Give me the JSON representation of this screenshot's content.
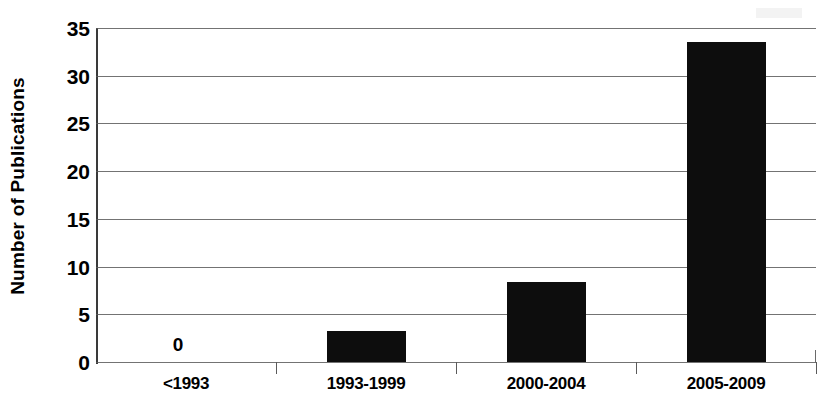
{
  "chart_data": {
    "type": "bar",
    "title": "",
    "xlabel": "",
    "ylabel": "Number of Publications",
    "categories": [
      "<1993",
      "1993-1999",
      "2000-2004",
      "2005-2009"
    ],
    "values": [
      0,
      3.2,
      8.4,
      33.5
    ],
    "point_labels": [
      "0",
      "",
      "",
      ""
    ],
    "ylim": [
      0,
      35
    ],
    "ytick_values": [
      0,
      5,
      10,
      15,
      20,
      25,
      30,
      35
    ],
    "ytick_labels": [
      "0",
      "5",
      "10",
      "15",
      "20",
      "25",
      "30",
      "35"
    ],
    "grid": true,
    "legend": false,
    "legend_position": "none",
    "bar_color": "#0d0d0d",
    "gridline_color": "#5a5a5a",
    "background_color": "#ffffff"
  },
  "axes": {
    "y_title": "Number of Publications"
  }
}
